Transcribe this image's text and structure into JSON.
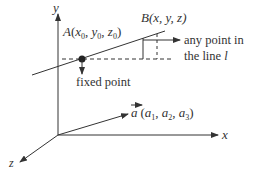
{
  "diagram": {
    "axes": {
      "x_label": "x",
      "y_label": "y",
      "z_label": "z"
    },
    "point_A": {
      "name": "A",
      "open": "(",
      "x": "x",
      "x_sub": "0",
      "y": "y",
      "y_sub": "0",
      "z": "z",
      "z_sub": "0",
      "sep": ", ",
      "close": ")"
    },
    "point_B": {
      "label": "B(x, y, z)"
    },
    "annotations": {
      "any_point_line1": "any point in",
      "any_point_line2_prefix": "the line ",
      "line_name": "l",
      "fixed_point": "fixed point"
    },
    "vector_a": {
      "name": "a",
      "open": "(",
      "c1": "a",
      "c1_sub": "1",
      "c2": "a",
      "c2_sub": "2",
      "c3": "a",
      "c3_sub": "3",
      "sep": ", ",
      "close": ")"
    },
    "colors": {
      "stroke": "#333333",
      "text": "#333333",
      "background": "#ffffff"
    }
  }
}
